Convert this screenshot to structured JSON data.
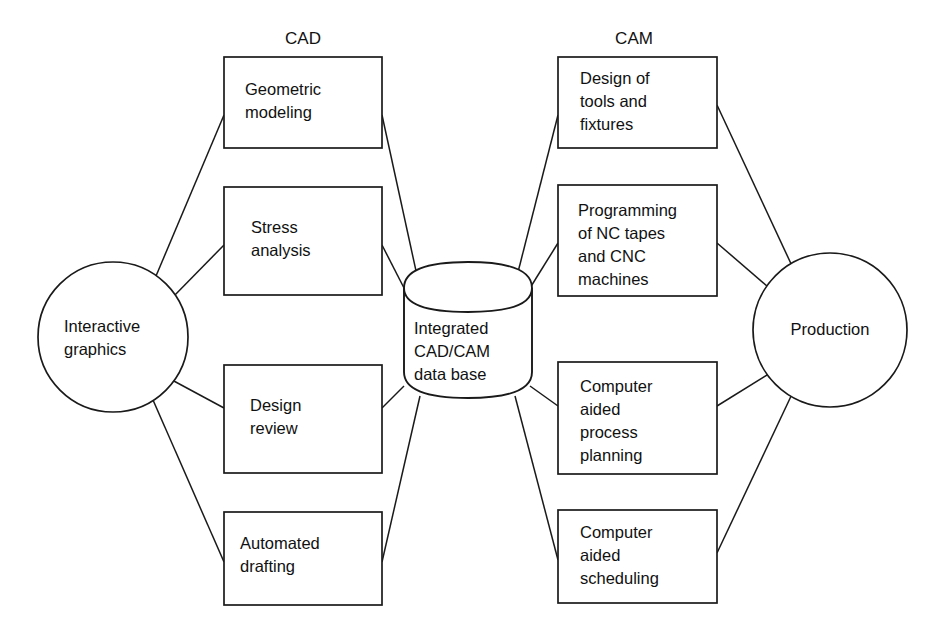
{
  "diagram": {
    "headers": {
      "cad": "CAD",
      "cam": "CAM"
    },
    "colors": {
      "stroke": "#1a1a1a",
      "fill": "#ffffff",
      "text": "#111111",
      "background": "#ffffff"
    },
    "nodes": {
      "interactive_graphics": {
        "shape": "circle",
        "lines": [
          "Interactive",
          "graphics"
        ],
        "line1": "Interactive",
        "line2": "graphics",
        "cx": 113,
        "cy": 337,
        "r": 75
      },
      "production": {
        "shape": "circle",
        "lines": [
          "Production"
        ],
        "line1": "Production",
        "cx": 830,
        "cy": 330,
        "r": 77
      },
      "database": {
        "shape": "cylinder",
        "lines": [
          "Integrated",
          "CAD/CAM",
          "data base"
        ],
        "line1": "Integrated",
        "line2": "CAD/CAM",
        "line3": "data base"
      },
      "geometric_modeling": {
        "shape": "rect",
        "group": "cad",
        "lines": [
          "Geometric",
          "modeling"
        ],
        "line1": "Geometric",
        "line2": "modeling"
      },
      "stress_analysis": {
        "shape": "rect",
        "group": "cad",
        "lines": [
          "Stress",
          "analysis"
        ],
        "line1": "Stress",
        "line2": "analysis"
      },
      "design_review": {
        "shape": "rect",
        "group": "cad",
        "lines": [
          "Design",
          "review"
        ],
        "line1": "Design",
        "line2": "review"
      },
      "automated_drafting": {
        "shape": "rect",
        "group": "cad",
        "lines": [
          "Automated",
          "drafting"
        ],
        "line1": "Automated",
        "line2": "drafting"
      },
      "design_of_tools_and_fixtures": {
        "shape": "rect",
        "group": "cam",
        "lines": [
          "Design of",
          "tools and",
          "fixtures"
        ],
        "line1": "Design of",
        "line2": "tools and",
        "line3": "fixtures"
      },
      "programming_nc_cnc": {
        "shape": "rect",
        "group": "cam",
        "lines": [
          "Programming",
          "of NC tapes",
          "and CNC",
          "machines"
        ],
        "line1": "Programming",
        "line2": "of NC tapes",
        "line3": "and CNC",
        "line4": "machines"
      },
      "computer_aided_process_planning": {
        "shape": "rect",
        "group": "cam",
        "lines": [
          "Computer",
          "aided",
          "process",
          "planning"
        ],
        "line1": "Computer",
        "line2": "aided",
        "line3": "process",
        "line4": "planning"
      },
      "computer_aided_scheduling": {
        "shape": "rect",
        "group": "cam",
        "lines": [
          "Computer",
          "aided",
          "scheduling"
        ],
        "line1": "Computer",
        "line2": "aided",
        "line3": "scheduling"
      }
    },
    "edges": [
      {
        "from": "interactive_graphics",
        "to": "geometric_modeling"
      },
      {
        "from": "interactive_graphics",
        "to": "stress_analysis"
      },
      {
        "from": "interactive_graphics",
        "to": "design_review"
      },
      {
        "from": "interactive_graphics",
        "to": "automated_drafting"
      },
      {
        "from": "geometric_modeling",
        "to": "database"
      },
      {
        "from": "stress_analysis",
        "to": "database"
      },
      {
        "from": "design_review",
        "to": "database"
      },
      {
        "from": "automated_drafting",
        "to": "database"
      },
      {
        "from": "database",
        "to": "design_of_tools_and_fixtures"
      },
      {
        "from": "database",
        "to": "programming_nc_cnc"
      },
      {
        "from": "database",
        "to": "computer_aided_process_planning"
      },
      {
        "from": "database",
        "to": "computer_aided_scheduling"
      },
      {
        "from": "design_of_tools_and_fixtures",
        "to": "production"
      },
      {
        "from": "programming_nc_cnc",
        "to": "production"
      },
      {
        "from": "computer_aided_process_planning",
        "to": "production"
      },
      {
        "from": "computer_aided_scheduling",
        "to": "production"
      }
    ]
  }
}
